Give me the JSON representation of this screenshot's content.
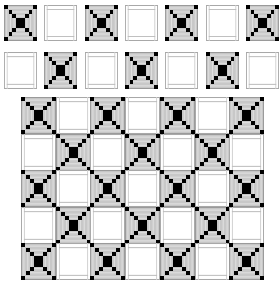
{
  "colors": {
    "background": "#ffffff",
    "block_fill": "#c8c8c8",
    "block_stripe": "#e2e2e2",
    "block_mark": "#000000",
    "plain_line": "#a8a8a8"
  },
  "tile_types": {
    "X": "x-block",
    "P": "plain-block"
  },
  "strip_1": {
    "label": "row-1",
    "tiles": [
      "X",
      "P",
      "X",
      "P",
      "X",
      "P",
      "X"
    ]
  },
  "strip_2": {
    "label": "row-2",
    "tiles": [
      "P",
      "X",
      "P",
      "X",
      "P",
      "X",
      "P"
    ]
  },
  "assembled_grid": {
    "rows": 5,
    "cols": 7,
    "layout": [
      [
        "X",
        "P",
        "X",
        "P",
        "X",
        "P",
        "X"
      ],
      [
        "P",
        "X",
        "P",
        "X",
        "P",
        "X",
        "P"
      ],
      [
        "X",
        "P",
        "X",
        "P",
        "X",
        "P",
        "X"
      ],
      [
        "P",
        "X",
        "P",
        "X",
        "P",
        "X",
        "P"
      ],
      [
        "X",
        "P",
        "X",
        "P",
        "X",
        "P",
        "X"
      ]
    ]
  }
}
